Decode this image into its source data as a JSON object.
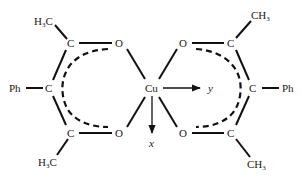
{
  "diagram": {
    "type": "chemical-structure",
    "center_atom": "Cu",
    "axes": {
      "x_label": "x",
      "y_label": "y"
    },
    "left_ligand": {
      "top_methyl": "H3C",
      "top_methyl_main": "H",
      "top_methyl_sub": "3",
      "top_methyl_tail": "C",
      "top_carbon": "C",
      "top_oxygen": "O",
      "middle_carbon": "C",
      "substituent": "Ph",
      "bottom_carbon": "C",
      "bottom_oxygen": "O",
      "bottom_methyl": "H3C",
      "bottom_methyl_main": "H",
      "bottom_methyl_sub": "3",
      "bottom_methyl_tail": "C"
    },
    "right_ligand": {
      "top_methyl": "CH3",
      "top_methyl_main": "CH",
      "top_methyl_sub": "3",
      "top_carbon": "C",
      "top_oxygen": "O",
      "middle_carbon": "C",
      "substituent": "Ph",
      "bottom_carbon": "C",
      "bottom_oxygen": "O",
      "bottom_methyl": "CH3",
      "bottom_methyl_main": "CH",
      "bottom_methyl_sub": "3"
    },
    "colors": {
      "ink": "#111111",
      "background": "#ffffff"
    }
  }
}
